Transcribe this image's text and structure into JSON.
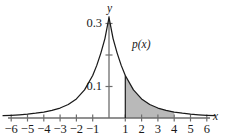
{
  "figure": {
    "title": "",
    "axis_labels": {
      "x": "x",
      "y": "y"
    },
    "curve_label": "p(x)",
    "colors": {
      "curve": "#1a1a1a",
      "axis": "#6d6d6d",
      "shading": "#b9b9b9",
      "text": "#1a1a1a",
      "background": "#ffffff"
    }
  },
  "chart_data": {
    "type": "line",
    "title": "",
    "xlabel": "x",
    "ylabel": "y",
    "grid": false,
    "legend_position": "inline-annotation",
    "xlim": [
      -6.6,
      6.6
    ],
    "ylim": [
      0,
      0.345
    ],
    "x_ticks": [
      -6,
      -5,
      -4,
      -3,
      -2,
      -1,
      1,
      2,
      3,
      4,
      5,
      6
    ],
    "x_tick_labels": [
      "−6",
      "−5",
      "−4",
      "−3",
      "−2",
      "−1",
      "1",
      "2",
      "3",
      "4",
      "5",
      "6"
    ],
    "y_ticks": [
      0.1,
      0.2,
      0.3
    ],
    "y_tick_labels": [
      "0.1",
      "",
      "0.3"
    ],
    "series": [
      {
        "name": "p(x)",
        "annotation": "p(x)",
        "description": "Peaked unimodal density centered at x = 0 with heavy tails",
        "x": [
          -6.5,
          -6,
          -5.5,
          -5,
          -4.5,
          -4,
          -3.5,
          -3,
          -2.5,
          -2,
          -1.5,
          -1,
          -0.75,
          -0.5,
          -0.25,
          0,
          0.25,
          0.5,
          0.75,
          1,
          1.5,
          2,
          2.5,
          3,
          3.5,
          4,
          4.5,
          5,
          5.5,
          6,
          6.5
        ],
        "y": [
          0.0075,
          0.0086,
          0.0103,
          0.0124,
          0.0152,
          0.0189,
          0.0241,
          0.0316,
          0.0429,
          0.0605,
          0.0891,
          0.135,
          0.167,
          0.206,
          0.252,
          0.3183,
          0.252,
          0.206,
          0.167,
          0.135,
          0.0891,
          0.0605,
          0.0429,
          0.0316,
          0.0241,
          0.0189,
          0.0152,
          0.0124,
          0.0103,
          0.0086,
          0.0075
        ],
        "peak_value": 0.318,
        "peak_x": 0
      }
    ],
    "shaded_region": {
      "label": "",
      "from_x": 1,
      "to_x": 4,
      "color": "#b9b9b9",
      "description": "Area under p(x) between x = 1 and x = 4"
    },
    "annotations": [
      {
        "text": "p(x)",
        "x": 2.05,
        "y": 0.235
      },
      {
        "text": "y",
        "x": 0.0,
        "y": 0.345
      },
      {
        "text": "x",
        "x": 6.55,
        "y": 0.0
      }
    ]
  }
}
